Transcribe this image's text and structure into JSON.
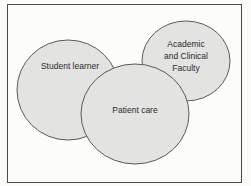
{
  "diagram": {
    "type": "venn",
    "circles": [
      {
        "id": "student",
        "label": "Student learner",
        "fill": "#e3e3e1",
        "stroke": "#5a5a5a"
      },
      {
        "id": "faculty",
        "label_lines": [
          "Academic",
          "and Clinical",
          "Faculty"
        ],
        "fill": "#e3e3e1",
        "stroke": "#5a5a5a"
      },
      {
        "id": "patient",
        "label": "Patient care",
        "fill": "#e3e3e1",
        "stroke": "#5a5a5a"
      }
    ]
  }
}
